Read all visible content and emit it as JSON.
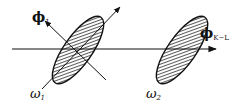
{
  "diagram": {
    "colors": {
      "background": "#ffffff",
      "stroke": "#111111",
      "hatch": "#222222"
    },
    "axis": {
      "name": "phi_K-L axis",
      "label_main": "ϕ",
      "label_sub": "K−L"
    },
    "principal_direction": {
      "label_main": "ϕ",
      "label_sub": "1"
    },
    "classes": [
      {
        "id": "omega1",
        "label_main": "ω",
        "label_sub": "1"
      },
      {
        "id": "omega2",
        "label_main": "ω",
        "label_sub": "2"
      }
    ]
  }
}
